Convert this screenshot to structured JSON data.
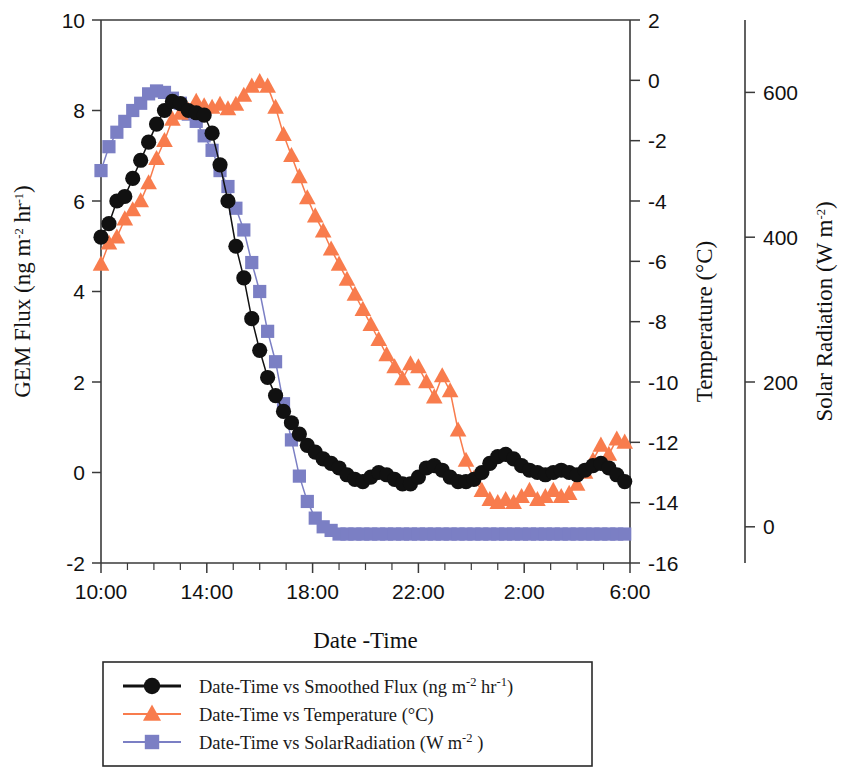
{
  "figure": {
    "kind": "scientific-line-chart",
    "background": "#ffffff"
  },
  "axes": {
    "left": {
      "title_text": "GEM Flux (ng m",
      "title_sup1": "-2",
      "title_mid": " hr",
      "title_sup2": "-1",
      "title_end": ")",
      "title_plain": "GEM Flux (ng m-2 hr-1)",
      "ticks": [
        "10",
        "8",
        "6",
        "4",
        "2",
        "0",
        "-2"
      ],
      "min": -2,
      "max": 10
    },
    "right1": {
      "title_text": "Temperature (°C)",
      "ticks": [
        "2",
        "0",
        "-2",
        "-4",
        "-6",
        "-8",
        "-10",
        "-12",
        "-14",
        "-16"
      ],
      "min": -16,
      "max": 2
    },
    "right2": {
      "title_text": "Solar Radiation (W m",
      "title_sup": "-2",
      "title_end": ")",
      "title_plain": "Solar Radiation (W m-2)",
      "ticks": [
        "600",
        "400",
        "200",
        "0"
      ],
      "min": -50,
      "max": 700
    },
    "bottom": {
      "title": "Date -Time",
      "ticks": [
        "10:00",
        "14:00",
        "18:00",
        "22:00",
        "2:00",
        "6:00"
      ],
      "minor_tick_interval_hours": 1,
      "start_hour": 10,
      "end_hour": 30
    }
  },
  "legend": {
    "border_color": "#2a2a2a",
    "items": [
      {
        "name": "smoothed-flux",
        "marker": "circle",
        "color": "#111111",
        "text_main": "Date-Time vs Smoothed Flux (ng m",
        "sup1": "-2",
        "text_mid": " hr",
        "sup2": "-1",
        "text_end": ")",
        "plain": "Date-Time vs Smoothed Flux (ng m-2 hr-1)"
      },
      {
        "name": "temperature",
        "marker": "triangle",
        "color": "#f87c4d",
        "text_main": "Date-Time vs Temperature (°C)",
        "sup1": "",
        "text_mid": "",
        "sup2": "",
        "text_end": "",
        "plain": "Date-Time vs Temperature (°C)"
      },
      {
        "name": "solar-radiation",
        "marker": "square",
        "color": "#7b7fc4",
        "text_main": "Date-Time vs SolarRadiation (W m",
        "sup1": "-2",
        "text_mid": "",
        "sup2": "",
        "text_end": " )",
        "plain": "Date-Time vs SolarRadiation (W m-2 )"
      }
    ]
  },
  "chart_data": {
    "type": "line",
    "title": "",
    "xlabel": "Date -Time",
    "grid": false,
    "legend_position": "below-plot",
    "x_tick_labels": [
      "10:00",
      "14:00",
      "18:00",
      "22:00",
      "2:00",
      "6:00"
    ],
    "x_hours": [
      10,
      14,
      18,
      22,
      26,
      30
    ],
    "xlim": [
      10,
      30
    ],
    "series": [
      {
        "name": "Date-Time vs Smoothed Flux (ng m-2 hr-1)",
        "axis": "left",
        "ylabel": "GEM Flux (ng m-2 hr-1)",
        "ylim": [
          -2,
          10
        ],
        "color": "#111111",
        "marker": "circle",
        "x": [
          10.0,
          10.3,
          10.6,
          10.9,
          11.2,
          11.5,
          11.8,
          12.1,
          12.4,
          12.7,
          13.0,
          13.3,
          13.6,
          13.9,
          14.2,
          14.5,
          14.8,
          15.1,
          15.4,
          15.7,
          16.0,
          16.3,
          16.6,
          16.9,
          17.2,
          17.5,
          17.8,
          18.1,
          18.4,
          18.7,
          19.0,
          19.3,
          19.6,
          19.9,
          20.2,
          20.5,
          20.8,
          21.1,
          21.4,
          21.7,
          22.0,
          22.3,
          22.6,
          22.9,
          23.2,
          23.5,
          23.8,
          24.1,
          24.4,
          24.7,
          25.0,
          25.3,
          25.6,
          25.9,
          26.2,
          26.5,
          26.8,
          27.1,
          27.4,
          27.7,
          28.0,
          28.3,
          28.6,
          28.9,
          29.2,
          29.5,
          29.8
        ],
        "y": [
          5.2,
          5.5,
          6.0,
          6.1,
          6.5,
          6.9,
          7.3,
          7.7,
          8.0,
          8.2,
          8.15,
          8.0,
          7.95,
          7.9,
          7.5,
          6.8,
          6.0,
          5.0,
          4.3,
          3.4,
          2.7,
          2.1,
          1.7,
          1.35,
          1.1,
          0.85,
          0.6,
          0.45,
          0.3,
          0.2,
          0.1,
          -0.05,
          -0.15,
          -0.2,
          -0.1,
          0.0,
          -0.05,
          -0.15,
          -0.25,
          -0.25,
          -0.1,
          0.1,
          0.15,
          0.05,
          -0.1,
          -0.2,
          -0.2,
          -0.15,
          0.0,
          0.2,
          0.35,
          0.4,
          0.3,
          0.15,
          0.05,
          0.0,
          -0.05,
          0.0,
          0.05,
          0.0,
          -0.05,
          0.05,
          0.15,
          0.2,
          0.1,
          -0.05,
          -0.2
        ]
      },
      {
        "name": "Date-Time vs Temperature (°C)",
        "axis": "right1",
        "ylabel": "Temperature (°C)",
        "ylim": [
          -16,
          2
        ],
        "color": "#f87c4d",
        "marker": "triangle",
        "x": [
          10.0,
          10.3,
          10.6,
          10.9,
          11.2,
          11.5,
          11.8,
          12.1,
          12.4,
          12.7,
          13.0,
          13.3,
          13.6,
          13.9,
          14.2,
          14.5,
          14.8,
          15.1,
          15.4,
          15.7,
          16.0,
          16.3,
          16.6,
          16.9,
          17.2,
          17.5,
          17.8,
          18.1,
          18.4,
          18.7,
          19.0,
          19.3,
          19.6,
          19.9,
          20.2,
          20.5,
          20.8,
          21.1,
          21.4,
          21.7,
          22.0,
          22.3,
          22.6,
          22.9,
          23.2,
          23.5,
          23.8,
          24.1,
          24.4,
          24.7,
          25.0,
          25.3,
          25.6,
          25.9,
          26.2,
          26.5,
          26.8,
          27.1,
          27.4,
          27.7,
          28.0,
          28.3,
          28.6,
          28.9,
          29.2,
          29.5,
          29.8
        ],
        "y": [
          -6.1,
          -5.4,
          -5.2,
          -4.6,
          -4.3,
          -4.0,
          -3.4,
          -2.6,
          -2.0,
          -1.3,
          -1.1,
          -1.0,
          -0.7,
          -0.85,
          -0.9,
          -0.8,
          -0.95,
          -0.8,
          -0.5,
          -0.2,
          -0.05,
          -0.2,
          -0.9,
          -1.8,
          -2.5,
          -3.2,
          -3.9,
          -4.5,
          -5.0,
          -5.6,
          -6.1,
          -6.6,
          -7.1,
          -7.6,
          -8.1,
          -8.6,
          -9.1,
          -9.5,
          -9.9,
          -9.4,
          -9.5,
          -10.0,
          -10.5,
          -9.8,
          -10.3,
          -11.6,
          -12.6,
          -13.2,
          -13.6,
          -13.9,
          -14.0,
          -13.9,
          -14.0,
          -13.8,
          -13.6,
          -13.9,
          -13.8,
          -13.6,
          -13.8,
          -13.7,
          -13.4,
          -13.0,
          -12.6,
          -12.1,
          -12.4,
          -11.9,
          -12.0
        ]
      },
      {
        "name": "Date-Time vs SolarRadiation (W m-2)",
        "axis": "right2",
        "ylabel": "Solar Radiation (W m-2)",
        "ylim": [
          -50,
          700
        ],
        "color": "#7b7fc4",
        "marker": "square",
        "x": [
          10.0,
          10.3,
          10.6,
          10.9,
          11.2,
          11.5,
          11.8,
          12.1,
          12.4,
          12.7,
          13.0,
          13.3,
          13.6,
          13.9,
          14.2,
          14.5,
          14.8,
          15.1,
          15.4,
          15.7,
          16.0,
          16.3,
          16.6,
          16.9,
          17.2,
          17.5,
          17.8,
          18.1,
          18.4,
          18.7,
          19.0,
          19.3,
          19.6,
          19.9,
          20.2,
          20.5,
          20.8,
          21.1,
          21.4,
          21.7,
          22.0,
          22.3,
          22.6,
          22.9,
          23.2,
          23.5,
          23.8,
          24.1,
          24.4,
          24.7,
          25.0,
          25.3,
          25.6,
          25.9,
          26.2,
          26.5,
          26.8,
          27.1,
          27.4,
          27.7,
          28.0,
          28.3,
          28.6,
          28.9,
          29.2,
          29.5,
          29.8
        ],
        "y": [
          492,
          525,
          545,
          560,
          575,
          585,
          598,
          602,
          600,
          592,
          585,
          570,
          560,
          540,
          520,
          492,
          470,
          440,
          410,
          365,
          325,
          270,
          228,
          170,
          120,
          70,
          35,
          12,
          0,
          -5,
          -10,
          -10,
          -10,
          -10,
          -10,
          -10,
          -10,
          -10,
          -10,
          -10,
          -10,
          -10,
          -10,
          -10,
          -10,
          -10,
          -10,
          -10,
          -10,
          -10,
          -10,
          -10,
          -10,
          -10,
          -10,
          -10,
          -10,
          -10,
          -10,
          -10,
          -10,
          -10,
          -10,
          -10,
          -10,
          -10,
          -10
        ]
      }
    ]
  }
}
